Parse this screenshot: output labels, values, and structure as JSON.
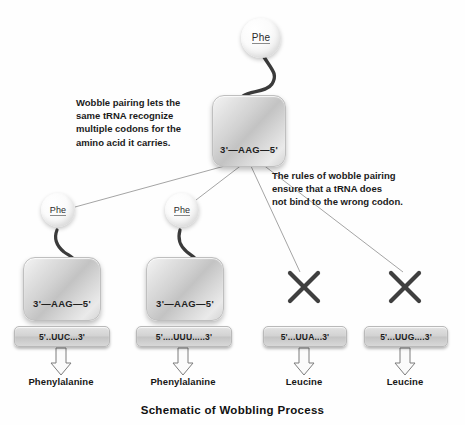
{
  "caption": "Schematic of Wobbling Process",
  "notes": {
    "left": [
      "Wobble pairing lets the",
      "same tRNA recognize",
      "multiple codons for the",
      "amino acid it carries."
    ],
    "right": [
      "The rules of wobble pairing",
      "ensure that a tRNA does",
      "not bind to the wrong codon."
    ]
  },
  "parent": {
    "amino_acid": "Phe",
    "anticodon": "3'—AAG—5'"
  },
  "branches": [
    {
      "amino_acid": "Phe",
      "anticodon": "3'—AAG—5'",
      "codon": "5'..UUC...3'",
      "product": "Phenylalanine",
      "binds": true
    },
    {
      "amino_acid": "Phe",
      "anticodon": "3'—AAG—5'",
      "codon": "5'....UUU.....3'",
      "product": "Phenylalanine",
      "binds": true
    },
    {
      "amino_acid": null,
      "anticodon": null,
      "codon": "5'...UUA...3'",
      "product": "Leucine",
      "binds": false
    },
    {
      "amino_acid": null,
      "anticodon": null,
      "codon": "5'...UUG....3'",
      "product": "Leucine",
      "binds": false
    }
  ],
  "colors": {
    "background": "#fefefe",
    "stem": "#3b3b3b",
    "connector_line": "#9a9a9a",
    "x_mark": "#3f3f3f",
    "arrow_outline": "#7d7d7d",
    "text": "#1b1b1b"
  }
}
